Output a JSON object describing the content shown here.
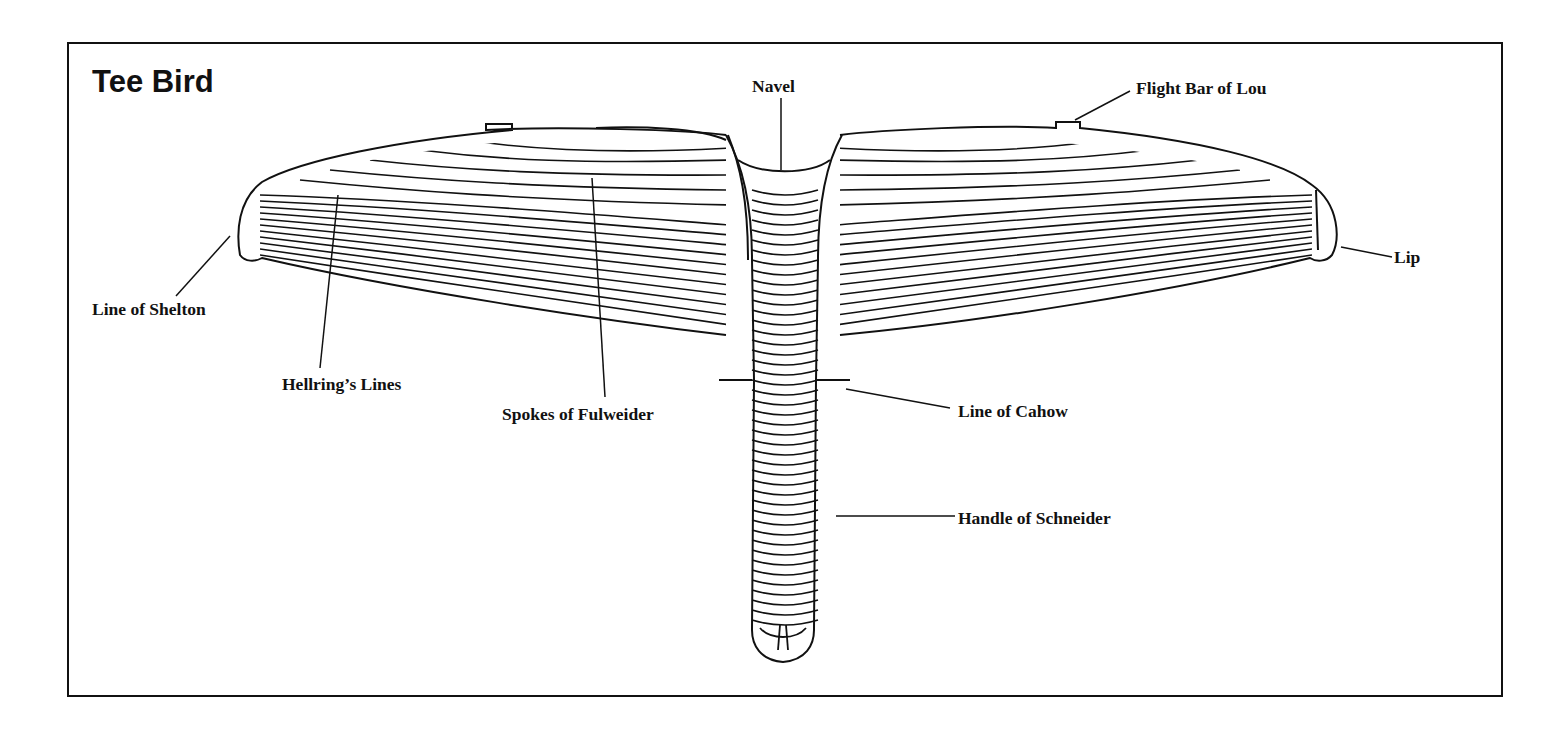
{
  "figure": {
    "title": "Tee Bird",
    "labels": {
      "navel": "Navel",
      "flight_bar": "Flight Bar of Lou",
      "lip": "Lip",
      "line_of_shelton": "Line of Shelton",
      "hellrings_lines": "Hellring’s Lines",
      "spokes_of_fulweider": "Spokes of Fulweider",
      "line_of_cahow": "Line of Cahow",
      "handle_of_schneider": "Handle of Schneider"
    },
    "colors": {
      "ink": "#111111",
      "paper": "#ffffff"
    }
  }
}
